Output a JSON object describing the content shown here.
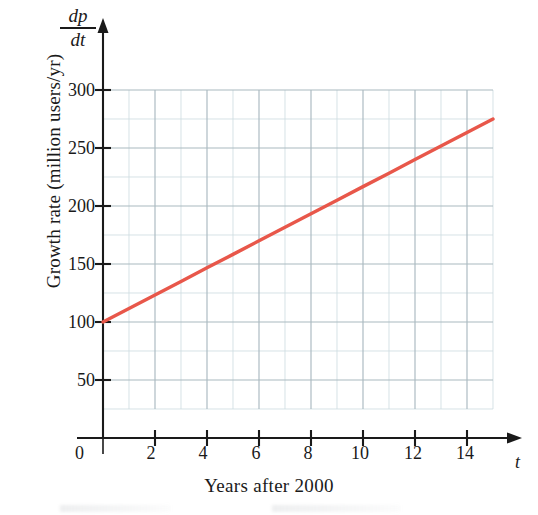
{
  "figure": {
    "kind": "line-graph",
    "background_color": "#ffffff"
  },
  "axes": {
    "y_axis_symbol_numerator": "dp",
    "y_axis_symbol_denominator": "dt",
    "y_axis_title": "Growth rate (million users/yr)",
    "x_axis_title": "Years after 2000",
    "x_axis_symbol": "t",
    "origin_label": "0",
    "y_tick_labels": [
      "300",
      "250",
      "200",
      "150",
      "100",
      "50"
    ],
    "x_tick_labels": [
      "2",
      "4",
      "6",
      "8",
      "10",
      "12",
      "14"
    ]
  },
  "colors": {
    "line": "#e8574a",
    "axis": "#1a1a1a",
    "grid_major": "#aab9c0",
    "grid_minor": "#cfdde1",
    "text": "#1a1a1a"
  },
  "chart_data": {
    "type": "line",
    "title": "",
    "xlabel": "Years after 2000",
    "ylabel": "Growth rate (million users/yr)",
    "xlim": [
      0,
      15
    ],
    "ylim": [
      0,
      300
    ],
    "grid": true,
    "legend": "none",
    "x_ticks": [
      0,
      2,
      4,
      6,
      8,
      10,
      12,
      14
    ],
    "y_ticks": [
      50,
      100,
      150,
      200,
      250,
      300
    ],
    "x_minor_step": 1,
    "y_minor_step": 25,
    "plot_area": {
      "x_min": 0,
      "x_max": 15,
      "y_min": 25,
      "y_max": 300
    },
    "series": [
      {
        "name": "dp/dt",
        "color": "#e8574a",
        "x": [
          0,
          1,
          2,
          3,
          4,
          5,
          6,
          7,
          8,
          9,
          10,
          11,
          12,
          13,
          14,
          15
        ],
        "values": [
          100,
          111.7,
          123.3,
          135,
          146.7,
          158.3,
          170,
          181.7,
          193.3,
          205,
          216.7,
          228.3,
          240,
          251.7,
          263.3,
          275
        ],
        "intercept": 100,
        "slope": 11.67,
        "endpoints": [
          [
            0,
            100
          ],
          [
            15,
            275
          ]
        ]
      }
    ]
  }
}
